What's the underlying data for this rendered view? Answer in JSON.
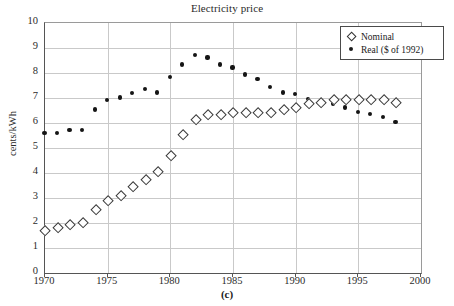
{
  "chart_data": {
    "type": "scatter",
    "title": "Electricity price",
    "xlabel": "",
    "ylabel": "cents/kWh",
    "panel_caption": "(c)",
    "xlim": [
      1970,
      2000
    ],
    "ylim": [
      0,
      10
    ],
    "xticks": [
      1970,
      1975,
      1980,
      1985,
      1990,
      1995,
      2000
    ],
    "yticks": [
      0,
      1,
      2,
      3,
      4,
      5,
      6,
      7,
      8,
      9,
      10
    ],
    "grid": true,
    "legend_position": "top-right",
    "x": [
      1970,
      1971,
      1972,
      1973,
      1974,
      1975,
      1976,
      1977,
      1978,
      1979,
      1980,
      1981,
      1982,
      1983,
      1984,
      1985,
      1986,
      1987,
      1988,
      1989,
      1990,
      1991,
      1992,
      1993,
      1994,
      1995,
      1996,
      1997,
      1998
    ],
    "series": [
      {
        "name": "Nominal",
        "marker": "open-diamond",
        "color": "#333333",
        "values": [
          1.7,
          1.82,
          1.92,
          2.03,
          2.53,
          2.9,
          3.1,
          3.45,
          3.75,
          4.05,
          4.68,
          5.54,
          6.13,
          6.33,
          6.33,
          6.42,
          6.43,
          6.42,
          6.42,
          6.55,
          6.62,
          6.76,
          6.82,
          6.92,
          6.95,
          6.95,
          6.94,
          6.94,
          6.82
        ]
      },
      {
        "name": "Real ($ of 1992)",
        "marker": "filled-circle",
        "color": "#151515",
        "values": [
          5.59,
          5.59,
          5.7,
          5.7,
          6.52,
          6.91,
          7.0,
          7.19,
          7.33,
          7.2,
          7.81,
          8.32,
          8.71,
          8.6,
          8.32,
          8.2,
          7.92,
          7.73,
          7.42,
          7.2,
          7.13,
          6.94,
          6.82,
          6.76,
          6.6,
          6.42,
          6.33,
          6.21,
          6.03
        ]
      }
    ]
  },
  "legend": {
    "items": [
      {
        "label": "Nominal",
        "marker": "open-diamond"
      },
      {
        "label": "Real ($ of 1992)",
        "marker": "filled-circle"
      }
    ]
  },
  "axes": {
    "y_title": "cents/kWh",
    "y_tick_labels": [
      "0",
      "1",
      "2",
      "3",
      "4",
      "5",
      "6",
      "7",
      "8",
      "9",
      "10"
    ],
    "x_tick_labels": [
      "1970",
      "1975",
      "1980",
      "1985",
      "1990",
      "1995",
      "2000"
    ]
  },
  "colors": {
    "grid": "#c9c9c9",
    "axis": "#555555",
    "marker_outline": "#333333",
    "marker_fill": "#151515",
    "background": "#ffffff"
  }
}
